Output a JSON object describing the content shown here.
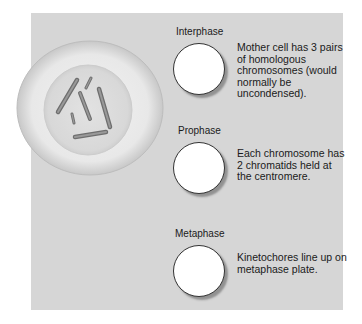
{
  "diagram": {
    "colors": {
      "panel": "#d6d6d6",
      "cell_outer": "#e6e6e6",
      "nucleus": "#dcdcdc",
      "chromosome": "#888888",
      "stage_circle": "#ffffff"
    },
    "cell": {
      "label": "",
      "chromosome_count": 6
    },
    "stages": [
      {
        "name": "Interphase",
        "description": "Mother cell has 3 pairs of homologous chromosomes (would normally be uncondensed)."
      },
      {
        "name": "Prophase",
        "description": "Each chromosome has 2 chromatids held at the centromere."
      },
      {
        "name": "Metaphase",
        "description": "Kinetochores line up on metaphase plate."
      }
    ]
  }
}
